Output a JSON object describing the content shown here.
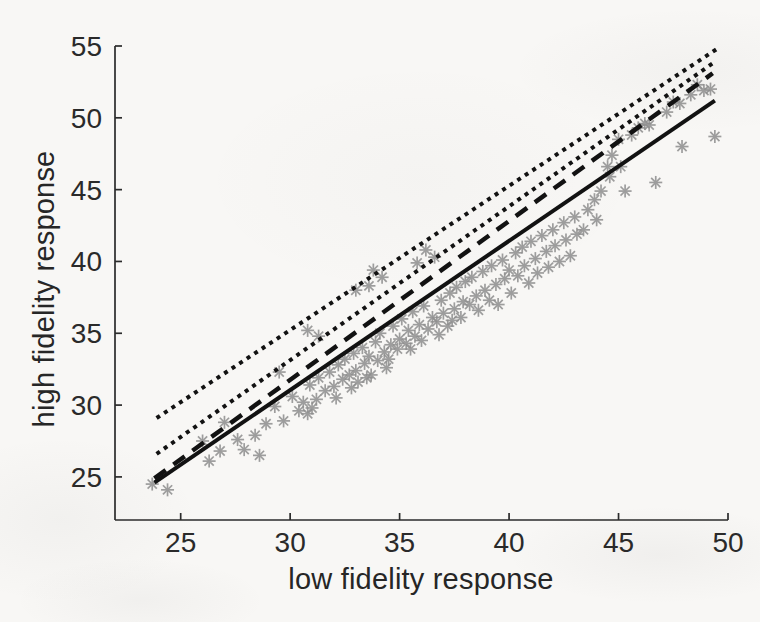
{
  "figure": {
    "x_axis_title": "low fidelity response",
    "y_axis_title": "high fidelity response",
    "axis_color": "#2b2b2b",
    "tick_label_color": "#2a2a2a"
  },
  "chart_data": {
    "type": "scatter",
    "title": "",
    "xlabel": "low fidelity response",
    "ylabel": "high fidelity response",
    "xlim": [
      22,
      50
    ],
    "ylim": [
      22,
      55
    ],
    "x_ticks": [
      25,
      30,
      35,
      40,
      45,
      50
    ],
    "y_ticks": [
      25,
      30,
      35,
      40,
      45,
      50,
      55
    ],
    "grid": false,
    "legend": "none",
    "marker": {
      "shape": "asterisk",
      "color": "#8e8e8e",
      "diameter_px": 13
    },
    "line_color": "#121212",
    "lines": [
      {
        "name": "solid-reference-line",
        "style": "solid",
        "from": [
          23.8,
          24.6
        ],
        "to": [
          49.4,
          51.2
        ]
      },
      {
        "name": "dashed-fit-line",
        "style": "dashed",
        "from": [
          23.8,
          24.9
        ],
        "to": [
          49.3,
          53.1
        ]
      },
      {
        "name": "dotted-bound-lower",
        "style": "dotted",
        "from": [
          23.9,
          26.6
        ],
        "to": [
          49.4,
          53.9
        ]
      },
      {
        "name": "dotted-bound-upper",
        "style": "dotted",
        "from": [
          23.9,
          29.1
        ],
        "to": [
          49.5,
          54.8
        ]
      }
    ],
    "series": [
      {
        "name": "response-samples",
        "points": [
          [
            23.7,
            24.5
          ],
          [
            24.4,
            24.1
          ],
          [
            26.0,
            27.5
          ],
          [
            26.3,
            26.1
          ],
          [
            26.8,
            26.8
          ],
          [
            27.0,
            28.8
          ],
          [
            27.6,
            27.6
          ],
          [
            27.9,
            26.9
          ],
          [
            28.4,
            27.9
          ],
          [
            28.6,
            26.5
          ],
          [
            28.9,
            28.7
          ],
          [
            29.3,
            29.9
          ],
          [
            29.5,
            32.3
          ],
          [
            29.7,
            28.9
          ],
          [
            30.1,
            30.6
          ],
          [
            30.4,
            29.6
          ],
          [
            30.6,
            30.2
          ],
          [
            30.8,
            29.4
          ],
          [
            30.8,
            35.2
          ],
          [
            30.9,
            31.4
          ],
          [
            31.0,
            29.8
          ],
          [
            31.2,
            30.4
          ],
          [
            31.3,
            31.9
          ],
          [
            31.3,
            34.8
          ],
          [
            31.6,
            31.0
          ],
          [
            31.8,
            32.3
          ],
          [
            32.0,
            31.3
          ],
          [
            32.1,
            30.5
          ],
          [
            32.2,
            32.8
          ],
          [
            32.4,
            31.8
          ],
          [
            32.5,
            33.2
          ],
          [
            32.7,
            32.1
          ],
          [
            32.8,
            31.2
          ],
          [
            32.9,
            33.6
          ],
          [
            33.0,
            32.4
          ],
          [
            33.0,
            38.0
          ],
          [
            33.1,
            31.6
          ],
          [
            33.3,
            34.0
          ],
          [
            33.4,
            32.9
          ],
          [
            33.5,
            31.9
          ],
          [
            33.6,
            33.4
          ],
          [
            33.6,
            38.3
          ],
          [
            33.7,
            32.1
          ],
          [
            33.8,
            39.4
          ],
          [
            33.9,
            34.4
          ],
          [
            34.0,
            33.1
          ],
          [
            34.1,
            35.0
          ],
          [
            34.2,
            38.9
          ],
          [
            34.3,
            33.7
          ],
          [
            34.4,
            32.6
          ],
          [
            34.5,
            33.2
          ],
          [
            34.6,
            34.2
          ],
          [
            34.7,
            35.5
          ],
          [
            34.9,
            33.9
          ],
          [
            35.0,
            34.6
          ],
          [
            35.1,
            36.0
          ],
          [
            35.3,
            34.3
          ],
          [
            35.4,
            35.2
          ],
          [
            35.5,
            33.9
          ],
          [
            35.6,
            36.5
          ],
          [
            35.7,
            34.8
          ],
          [
            35.8,
            39.9
          ],
          [
            35.9,
            35.6
          ],
          [
            36.0,
            34.5
          ],
          [
            36.1,
            36.9
          ],
          [
            36.2,
            40.8
          ],
          [
            36.3,
            35.3
          ],
          [
            36.5,
            36.1
          ],
          [
            36.6,
            40.3
          ],
          [
            36.7,
            35.8
          ],
          [
            36.8,
            34.9
          ],
          [
            36.9,
            37.3
          ],
          [
            37.0,
            36.4
          ],
          [
            37.2,
            35.5
          ],
          [
            37.3,
            37.8
          ],
          [
            37.4,
            35.9
          ],
          [
            37.5,
            36.7
          ],
          [
            37.6,
            38.2
          ],
          [
            37.8,
            36.1
          ],
          [
            37.9,
            37.2
          ],
          [
            38.0,
            38.6
          ],
          [
            38.2,
            37.0
          ],
          [
            38.3,
            38.9
          ],
          [
            38.5,
            37.6
          ],
          [
            38.6,
            36.6
          ],
          [
            38.8,
            39.3
          ],
          [
            38.9,
            38.0
          ],
          [
            39.1,
            37.3
          ],
          [
            39.2,
            39.7
          ],
          [
            39.4,
            38.4
          ],
          [
            39.5,
            37.0
          ],
          [
            39.7,
            40.1
          ],
          [
            39.8,
            38.8
          ],
          [
            40.0,
            39.4
          ],
          [
            40.1,
            37.8
          ],
          [
            40.3,
            40.6
          ],
          [
            40.4,
            39.0
          ],
          [
            40.6,
            41.0
          ],
          [
            40.7,
            39.7
          ],
          [
            40.9,
            38.5
          ],
          [
            41.0,
            41.4
          ],
          [
            41.2,
            40.2
          ],
          [
            41.3,
            39.2
          ],
          [
            41.5,
            41.8
          ],
          [
            41.7,
            40.7
          ],
          [
            41.8,
            39.6
          ],
          [
            42.0,
            42.2
          ],
          [
            42.1,
            41.1
          ],
          [
            42.3,
            40.0
          ],
          [
            42.5,
            42.7
          ],
          [
            42.6,
            41.5
          ],
          [
            42.8,
            40.4
          ],
          [
            43.0,
            43.1
          ],
          [
            43.1,
            41.9
          ],
          [
            43.4,
            42.2
          ],
          [
            43.6,
            43.6
          ],
          [
            43.9,
            44.3
          ],
          [
            44.0,
            42.9
          ],
          [
            44.2,
            44.9
          ],
          [
            44.5,
            46.6
          ],
          [
            44.6,
            45.9
          ],
          [
            44.7,
            47.4
          ],
          [
            45.0,
            48.5
          ],
          [
            45.1,
            46.6
          ],
          [
            45.3,
            44.9
          ],
          [
            45.6,
            48.8
          ],
          [
            45.9,
            49.3
          ],
          [
            46.2,
            49.6
          ],
          [
            46.4,
            49.5
          ],
          [
            46.7,
            45.5
          ],
          [
            47.2,
            50.4
          ],
          [
            47.5,
            51.1
          ],
          [
            47.8,
            51.0
          ],
          [
            47.9,
            48.0
          ],
          [
            48.3,
            51.6
          ],
          [
            48.6,
            52.3
          ],
          [
            48.9,
            51.9
          ],
          [
            49.2,
            52.0
          ],
          [
            49.4,
            48.7
          ]
        ]
      }
    ]
  }
}
